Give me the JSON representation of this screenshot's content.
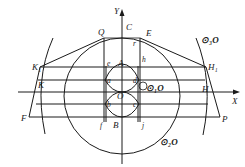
{
  "figure": {
    "type": "geometric construction",
    "axes": {
      "x_label": "X",
      "y_label": "Y"
    },
    "points": {
      "Y": "Y",
      "C": "C",
      "Q": "Q",
      "E": "E",
      "r": "r",
      "e": "e",
      "A": "A",
      "h": "h",
      "K1": "K₁",
      "H1": "H₁",
      "K": "K",
      "H": "H",
      "a": "a",
      "d": "d",
      "O": "O",
      "b": "b",
      "c": "c",
      "F": "F",
      "P": "P",
      "f": "f",
      "B": "B",
      "j": "j"
    },
    "circles": {
      "c1": "⊙₁O",
      "c2": "⊙₂O",
      "c3": "⊙₃O"
    }
  }
}
